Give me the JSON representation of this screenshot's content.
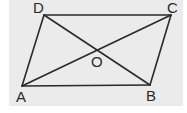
{
  "diagram": {
    "type": "parallelogram",
    "colors": {
      "background": "#ebebeb",
      "stroke": "#2a2a2a"
    },
    "vertices": {
      "A": {
        "label": "A",
        "x": 22,
        "y": 86
      },
      "B": {
        "label": "B",
        "x": 150,
        "y": 85
      },
      "C": {
        "label": "C",
        "x": 171,
        "y": 15
      },
      "D": {
        "label": "D",
        "x": 44,
        "y": 15
      }
    },
    "intersection": {
      "label": "O",
      "x": 97,
      "y": 50
    },
    "edges": [
      "AB",
      "BC",
      "CD",
      "DA"
    ],
    "diagonals": [
      "AC",
      "BD"
    ]
  }
}
